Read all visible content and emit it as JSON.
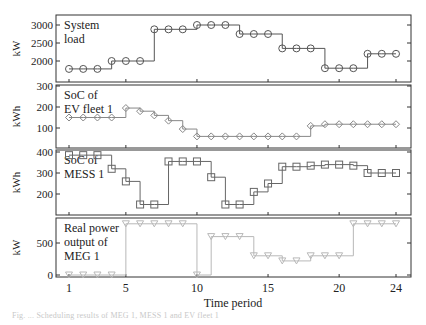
{
  "figure": {
    "xlabel": "Time period",
    "x_ticks": [
      1,
      5,
      10,
      15,
      20,
      24
    ],
    "caption": "Fig. ... Scheduling results of MEG 1, MESS 1 and EV fleet 1"
  },
  "chart_data": [
    {
      "type": "line",
      "step": true,
      "title": "System load",
      "ylabel": "kW",
      "ylim": [
        1650,
        3200
      ],
      "yticks": [
        2000,
        2500,
        3000
      ],
      "marker": "circle",
      "color": "#555555",
      "x": [
        1,
        2,
        3,
        4,
        5,
        6,
        7,
        8,
        9,
        10,
        11,
        12,
        13,
        14,
        15,
        16,
        17,
        18,
        19,
        20,
        21,
        22,
        23,
        24
      ],
      "values": [
        1780,
        1780,
        1780,
        2000,
        2000,
        2000,
        2880,
        2880,
        2880,
        3000,
        3000,
        3000,
        2750,
        2750,
        2750,
        2350,
        2350,
        2350,
        1800,
        1800,
        1800,
        2200,
        2200,
        2200
      ]
    },
    {
      "type": "line",
      "step": true,
      "title": "SoC of EV fleet 1",
      "ylabel": "kWh",
      "ylim": [
        30,
        300
      ],
      "yticks": [
        100,
        200,
        300
      ],
      "marker": "diamond",
      "color": "#888888",
      "x": [
        1,
        2,
        3,
        4,
        5,
        6,
        7,
        8,
        9,
        10,
        11,
        12,
        13,
        14,
        15,
        16,
        17,
        18,
        19,
        20,
        21,
        22,
        23,
        24
      ],
      "values": [
        150,
        150,
        150,
        150,
        195,
        180,
        160,
        135,
        95,
        60,
        60,
        60,
        60,
        60,
        60,
        60,
        60,
        110,
        118,
        118,
        118,
        118,
        118,
        118
      ]
    },
    {
      "type": "line",
      "step": true,
      "title": "SoC of MESS 1",
      "ylabel": "kWh",
      "ylim": [
        120,
        410
      ],
      "yticks": [
        200,
        300,
        400
      ],
      "marker": "square",
      "color": "#666666",
      "x": [
        1,
        2,
        3,
        4,
        5,
        6,
        7,
        8,
        9,
        10,
        11,
        12,
        13,
        14,
        15,
        16,
        17,
        18,
        19,
        20,
        21,
        22,
        23,
        24
      ],
      "values": [
        385,
        385,
        385,
        320,
        260,
        150,
        150,
        355,
        355,
        355,
        280,
        150,
        150,
        210,
        250,
        330,
        330,
        335,
        340,
        340,
        335,
        300,
        300,
        300
      ]
    },
    {
      "type": "line",
      "step": true,
      "title": "Real power output of MEG 1",
      "ylabel": "kW",
      "ylim": [
        0,
        880
      ],
      "yticks": [
        0,
        500
      ],
      "marker": "triangle-down",
      "color": "#b8b8b8",
      "x": [
        1,
        2,
        3,
        4,
        5,
        6,
        7,
        8,
        9,
        10,
        11,
        12,
        13,
        14,
        15,
        16,
        17,
        18,
        19,
        20,
        21,
        22,
        23,
        24
      ],
      "values": [
        0,
        0,
        0,
        0,
        800,
        800,
        800,
        800,
        800,
        0,
        600,
        600,
        600,
        300,
        300,
        220,
        220,
        300,
        300,
        300,
        800,
        800,
        800,
        800
      ]
    }
  ],
  "panels": [
    {
      "label_line1": "System",
      "label_line2": "load",
      "ylabel": "kW"
    },
    {
      "label_line1": "SoC of",
      "label_line2": "EV fleet 1",
      "ylabel": "kWh"
    },
    {
      "label_line1": "SoC of",
      "label_line2": "MESS 1",
      "ylabel": "kWh"
    },
    {
      "label_line1": "Real power",
      "label_line2": "output of",
      "label_line3": "MEG 1",
      "ylabel": "kW"
    }
  ]
}
